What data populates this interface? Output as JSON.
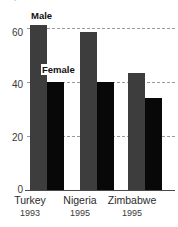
{
  "chart_data": {
    "type": "bar",
    "title": "",
    "xlabel": "",
    "ylabel": "",
    "categories": [
      "Turkey",
      "Nigeria",
      "Zimbabwe"
    ],
    "category_sublabels": [
      "1993",
      "1995",
      "1995"
    ],
    "series": [
      {
        "name": "Male",
        "values": [
          61,
          58.5,
          43.5
        ],
        "color": "#3d3d3d"
      },
      {
        "name": "Female",
        "values": [
          40,
          40,
          34
        ],
        "color": "#080808"
      }
    ],
    "ylim": [
      0,
      66
    ],
    "yticks": [
      0,
      20,
      40,
      60
    ],
    "ytick_labels": [
      "0",
      "20",
      "40",
      "60"
    ],
    "gridlines": [
      20,
      40,
      60
    ],
    "grid": true,
    "grid_style": "dashed",
    "legend": "inline-annotations",
    "legend_entries": [
      "Male",
      "Female"
    ]
  },
  "annotations": {
    "male_label": "Male",
    "female_label": "Female"
  },
  "axis": {
    "tick_0": "0",
    "tick_20": "20",
    "tick_40": "40",
    "tick_60": "60"
  },
  "categories": {
    "c0_name": "Turkey",
    "c0_year": "1993",
    "c1_name": "Nigeria",
    "c1_year": "1995",
    "c2_name": "Zimbabwe",
    "c2_year": "1995"
  },
  "title": {
    "text": "percent"
  }
}
